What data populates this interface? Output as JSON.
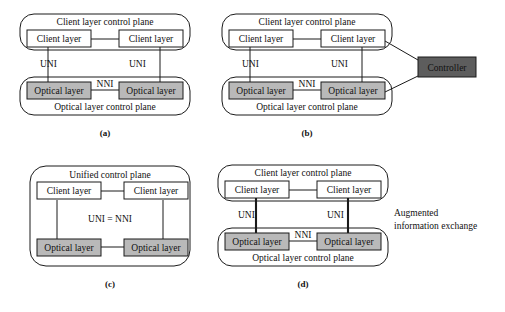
{
  "figure": {
    "background": "#ffffff",
    "stroke_color": "#1a1a1a",
    "gray_fill": "#b9b9b9",
    "dark_fill": "#5d5d5d",
    "white_fill": "#ffffff"
  },
  "panels": [
    {
      "id": "a",
      "caption": "(a)",
      "client_plane_label": "Client layer control plane",
      "optical_plane_label": "Optical layer control plane",
      "client_left": "Client layer",
      "client_right": "Client layer",
      "optical_left": "Optical layer",
      "optical_right": "Optical layer",
      "uni_left": "UNI",
      "uni_right": "UNI",
      "nni": "NNI"
    },
    {
      "id": "b",
      "caption": "(b)",
      "client_plane_label": "Client layer control plane",
      "optical_plane_label": "Optical layer control plane",
      "client_left": "Client layer",
      "client_right": "Client layer",
      "optical_left": "Optical layer",
      "optical_right": "Optical layer",
      "uni_left": "UNI",
      "uni_right": "UNI",
      "nni": "NNI",
      "controller": "Controller"
    },
    {
      "id": "c",
      "caption": "(c)",
      "unified_plane_label": "Unified control plane",
      "client_left": "Client layer",
      "client_right": "Client layer",
      "optical_left": "Optical layer",
      "optical_right": "Optical layer",
      "uni_nni": "UNI = NNI"
    },
    {
      "id": "d",
      "caption": "(d)",
      "client_plane_label": "Client layer control plane",
      "optical_plane_label": "Optical layer control plane",
      "client_left": "Client layer",
      "client_right": "Client layer",
      "optical_left": "Optical layer",
      "optical_right": "Optical layer",
      "uni_left": "UNI",
      "uni_right": "UNI",
      "nni": "NNI",
      "note_line1": "Augmented",
      "note_line2": "information exchange"
    }
  ]
}
